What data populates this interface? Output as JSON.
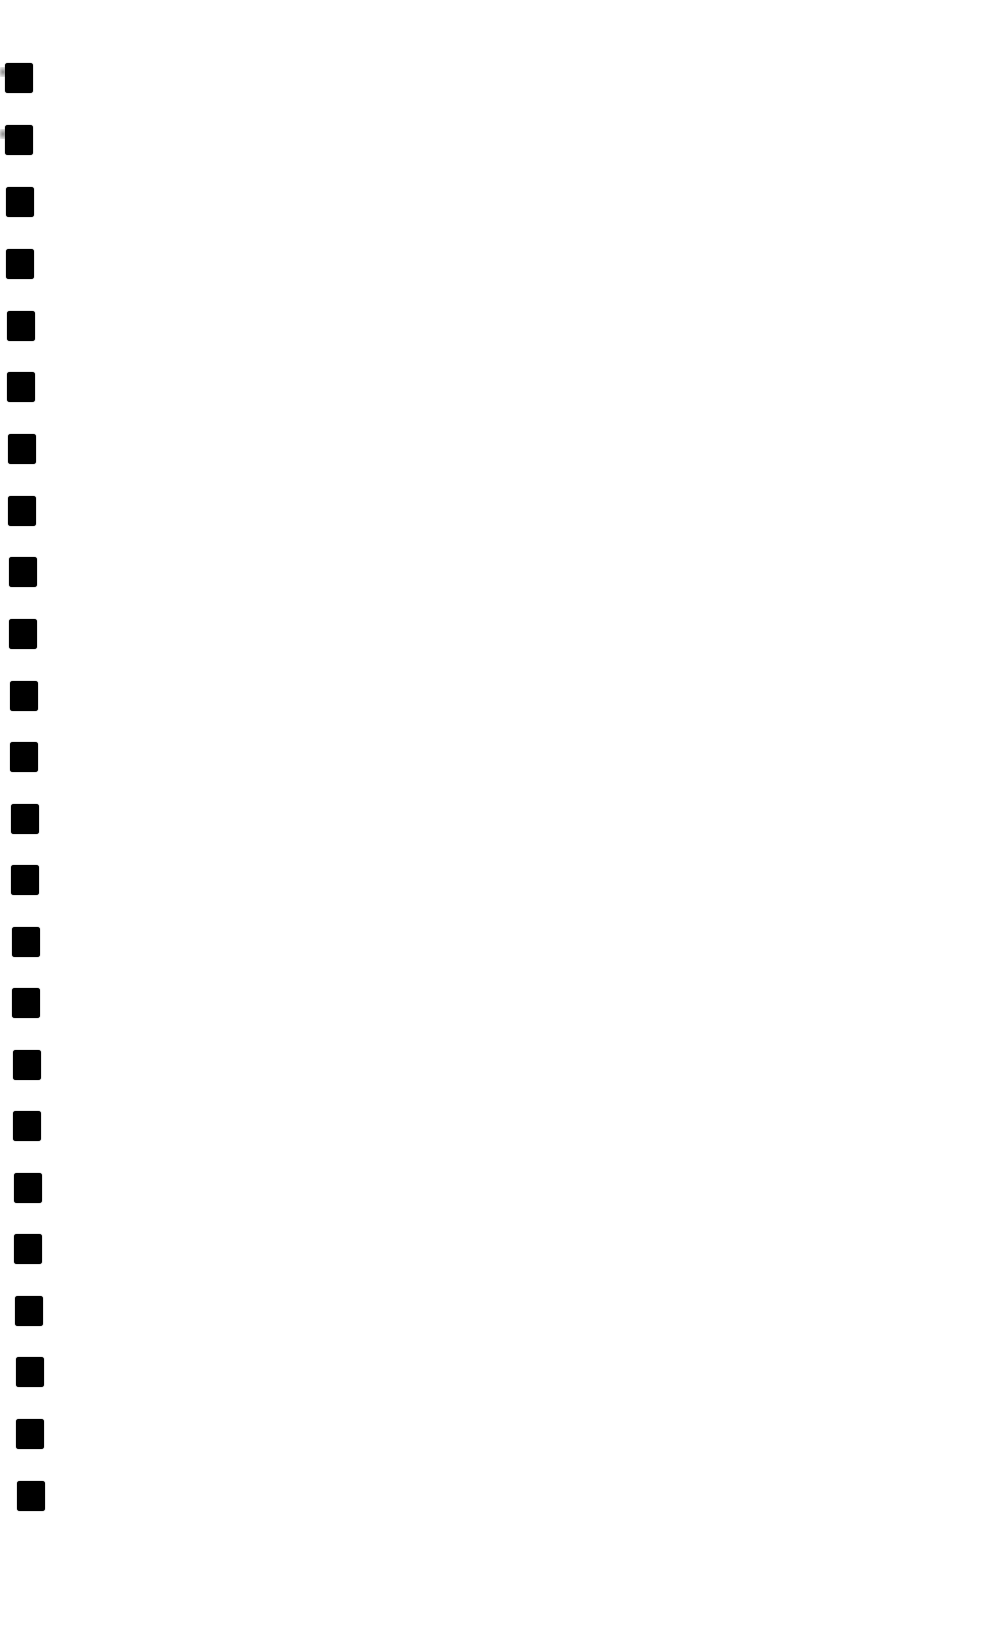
{
  "document": {
    "type": "scanned blank page",
    "background_color": "#ffffff",
    "text_content": ""
  },
  "binding_holes": {
    "count": 24,
    "color": "#000000",
    "shape": "rounded-square",
    "size": [
      28,
      30
    ],
    "positions": [
      {
        "x": 5,
        "y": 63
      },
      {
        "x": 5,
        "y": 125
      },
      {
        "x": 6,
        "y": 187
      },
      {
        "x": 6,
        "y": 249
      },
      {
        "x": 7,
        "y": 311
      },
      {
        "x": 7,
        "y": 372
      },
      {
        "x": 8,
        "y": 434
      },
      {
        "x": 8,
        "y": 496
      },
      {
        "x": 9,
        "y": 557
      },
      {
        "x": 9,
        "y": 619
      },
      {
        "x": 10,
        "y": 681
      },
      {
        "x": 10,
        "y": 742
      },
      {
        "x": 11,
        "y": 804
      },
      {
        "x": 11,
        "y": 865
      },
      {
        "x": 12,
        "y": 927
      },
      {
        "x": 12,
        "y": 988
      },
      {
        "x": 13,
        "y": 1050
      },
      {
        "x": 13,
        "y": 1111
      },
      {
        "x": 14,
        "y": 1173
      },
      {
        "x": 14,
        "y": 1234
      },
      {
        "x": 15,
        "y": 1296
      },
      {
        "x": 16,
        "y": 1357
      },
      {
        "x": 16,
        "y": 1419
      },
      {
        "x": 17,
        "y": 1481
      }
    ]
  }
}
